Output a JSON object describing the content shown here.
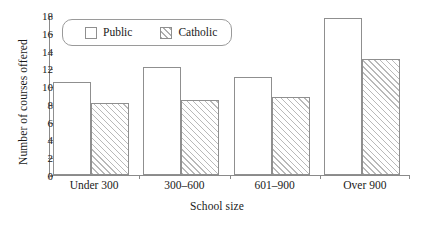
{
  "chart_data": {
    "type": "bar",
    "title": "",
    "xlabel": "School size",
    "ylabel": "Number of courses offered",
    "categories": [
      "Under 300",
      "300–600",
      "601–900",
      "Over 900"
    ],
    "series": [
      {
        "name": "Public",
        "values": [
          10.5,
          12.1,
          11.0,
          17.7
        ]
      },
      {
        "name": "Catholic",
        "values": [
          8.1,
          8.4,
          8.8,
          13.0
        ]
      }
    ],
    "ylim": [
      0,
      18
    ],
    "ytick_labels": [
      "0",
      "2",
      "4",
      "6",
      "8",
      "10",
      "12",
      "14",
      "16",
      "18"
    ],
    "ytick_values": [
      0,
      2,
      4,
      6,
      8,
      10,
      12,
      14,
      16,
      18
    ],
    "grid": false,
    "legend_position": "top-left-inside",
    "legend_entries": [
      {
        "label": "Public",
        "swatch": "open-square"
      },
      {
        "label": "Catholic",
        "swatch": "hatched-square"
      }
    ],
    "colors": {
      "bar_outline": "#8f8f8f",
      "bar_fill": "#ffffff",
      "hatch": "#b9b9b9",
      "axis": "#8a8a8a",
      "text": "#1a1a1a"
    }
  }
}
